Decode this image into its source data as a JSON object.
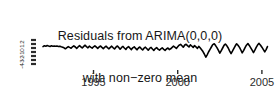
{
  "chart_data": {
    "type": "line",
    "title": "Residuals from ARIMA(0,0,0)\nwith non−zero mean",
    "title_line_1": "Residuals from ARIMA(0,0,0)",
    "title_line_2": "with non−zero mean",
    "xlabel": "",
    "ylabel": "",
    "xlim": [
      1992.0,
      2005.6
    ],
    "ylim": [
      -5.0,
      3.0
    ],
    "xticks": [
      1995,
      2000,
      2005
    ],
    "xtick_labels": [
      "1995",
      "2000",
      "2005"
    ],
    "yticks": [
      2,
      1,
      0,
      -1,
      -2,
      -3,
      -4
    ],
    "ytick_labels": [
      "2",
      "1",
      "0",
      "-1",
      "-2",
      "-3",
      "-4"
    ],
    "grid": false,
    "legend": "none",
    "line_color": "#000000",
    "line_width": 1.6,
    "series": [
      {
        "name": "residuals",
        "x": [
          1992.0,
          1992.08,
          1992.17,
          1992.25,
          1992.33,
          1992.42,
          1992.5,
          1992.58,
          1992.67,
          1992.75,
          1992.83,
          1992.92,
          1993.0,
          1993.08,
          1993.17,
          1993.25,
          1993.33,
          1993.42,
          1993.5,
          1993.58,
          1993.67,
          1993.75,
          1993.83,
          1993.92,
          1994.0,
          1994.08,
          1994.17,
          1994.25,
          1994.33,
          1994.42,
          1994.5,
          1994.58,
          1994.67,
          1994.75,
          1994.83,
          1994.92,
          1995.0,
          1995.08,
          1995.17,
          1995.25,
          1995.33,
          1995.42,
          1995.5,
          1995.58,
          1995.67,
          1995.75,
          1995.83,
          1995.92,
          1996.0,
          1996.08,
          1996.17,
          1996.25,
          1996.33,
          1996.42,
          1996.5,
          1996.58,
          1996.67,
          1996.75,
          1996.83,
          1996.92,
          1997.0,
          1997.08,
          1997.17,
          1997.25,
          1997.33,
          1997.42,
          1997.5,
          1997.58,
          1997.67,
          1997.75,
          1997.83,
          1997.92,
          1998.0,
          1998.08,
          1998.17,
          1998.25,
          1998.33,
          1998.42,
          1998.5,
          1998.58,
          1998.67,
          1998.75,
          1998.83,
          1998.92,
          1999.0,
          1999.08,
          1999.17,
          1999.25,
          1999.33,
          1999.42,
          1999.5,
          1999.58,
          1999.67,
          1999.75,
          1999.83,
          1999.92,
          2000.0,
          2000.08,
          2000.17,
          2000.25,
          2000.33,
          2000.42,
          2000.5,
          2000.58,
          2000.67,
          2000.75,
          2000.83,
          2000.92,
          2001.0,
          2001.08,
          2001.17,
          2001.25,
          2001.33,
          2001.42,
          2001.5,
          2001.58,
          2001.67,
          2001.75,
          2001.83,
          2001.92,
          2002.0,
          2002.08,
          2002.17,
          2002.25,
          2002.33,
          2002.42,
          2002.5,
          2002.58,
          2002.67,
          2002.75,
          2002.83,
          2002.92,
          2003.0,
          2003.08,
          2003.17,
          2003.25,
          2003.33,
          2003.42,
          2003.5,
          2003.58,
          2003.67,
          2003.75,
          2003.83,
          2003.92,
          2004.0,
          2004.08,
          2004.17,
          2004.25,
          2004.33,
          2004.42,
          2004.5,
          2004.58,
          2004.67,
          2004.75,
          2004.83,
          2004.92,
          2005.0,
          2005.08,
          2005.17,
          2005.25,
          2005.33
        ],
        "values": [
          0.35,
          0.55,
          0.45,
          0.6,
          0.5,
          0.4,
          0.55,
          0.45,
          0.5,
          0.42,
          0.48,
          0.38,
          0.45,
          0.3,
          0.2,
          0.05,
          -0.2,
          0.1,
          0.35,
          0.15,
          -0.05,
          0.3,
          0.55,
          0.25,
          -0.1,
          0.25,
          0.6,
          0.3,
          0.0,
          0.4,
          0.7,
          0.35,
          0.05,
          0.45,
          0.2,
          -0.05,
          0.3,
          0.55,
          0.2,
          -0.1,
          0.25,
          0.5,
          0.15,
          -0.15,
          0.2,
          0.45,
          0.1,
          -0.2,
          0.15,
          0.45,
          0.05,
          -0.25,
          0.2,
          0.5,
          0.1,
          -0.3,
          0.15,
          0.4,
          0.0,
          -0.35,
          0.1,
          0.35,
          -0.05,
          -0.4,
          0.05,
          0.3,
          -0.1,
          -0.45,
          0.0,
          0.25,
          -0.15,
          -0.5,
          -0.05,
          0.2,
          -0.2,
          -0.55,
          -0.1,
          0.15,
          -0.25,
          -0.6,
          -0.15,
          0.1,
          -0.3,
          -0.55,
          -0.2,
          0.05,
          -0.35,
          -0.6,
          -0.25,
          0.0,
          -0.4,
          -0.2,
          0.15,
          0.45,
          0.2,
          -0.1,
          0.3,
          0.7,
          0.9,
          0.55,
          0.2,
          0.75,
          0.95,
          0.6,
          0.25,
          0.8,
          0.5,
          0.15,
          0.6,
          0.3,
          -0.1,
          0.4,
          0.05,
          -0.45,
          -0.9,
          -1.5,
          -2.3,
          -1.7,
          -1.0,
          -0.35,
          0.25,
          0.85,
          1.05,
          0.6,
          0.1,
          -0.6,
          -1.3,
          -0.7,
          0.0,
          0.65,
          1.0,
          0.55,
          0.0,
          -0.7,
          -1.4,
          -0.8,
          -0.15,
          0.55,
          1.05,
          0.7,
          0.15,
          -0.5,
          -1.2,
          -0.6,
          0.1,
          0.7,
          1.1,
          0.65,
          0.1,
          -0.55,
          -1.15,
          -0.55,
          0.2,
          0.8,
          1.15,
          0.7,
          0.2,
          -0.35,
          -0.95,
          -0.4,
          0.35
        ]
      }
    ]
  },
  "plot": {
    "x_axis_line": true,
    "tick_color": "#2b2b2b",
    "axis_color": "#1a1a1a"
  }
}
